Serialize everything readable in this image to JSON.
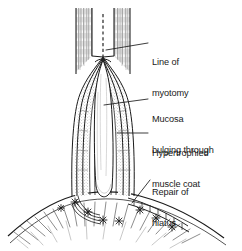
{
  "figure": {
    "background_color": "#ffffff",
    "ink_color": "#1a1a1a",
    "stipple_color": "#8d8d8d",
    "width": 242,
    "height": 251
  },
  "annotations": [
    {
      "id": "line-of-myotomy",
      "line1": "Line of",
      "line2": "myotomy",
      "leader_from": [
        148,
        43
      ],
      "leader_to": [
        106,
        50
      ]
    },
    {
      "id": "mucosa-bulging-through",
      "line1": "Mucosa",
      "line2": "bulging through",
      "leader_from": [
        148,
        99
      ],
      "leader_to": [
        104,
        105
      ]
    },
    {
      "id": "hypertrophied-muscle-coat",
      "line1": "Hypertrophied",
      "line2": "muscle coat",
      "leader_from": [
        148,
        133
      ],
      "leader_to": [
        118,
        133
      ]
    },
    {
      "id": "repair-of-hiatus",
      "line1": "Repair of",
      "line2": "hiatus",
      "leader_from": [
        150,
        180
      ],
      "leader_to": [
        132,
        203
      ]
    }
  ],
  "structures": {
    "oesophagus": "oesophageal tube with longitudinal muscle hatching",
    "myotomy_incision": "dashed vertical line marking the intended incision",
    "split_muscle": "hypertrophied muscle coat retracted to either side",
    "mucosa": "mucosa bulging through the myotomy",
    "diaphragm": "diaphragm with radiating fibre strokes",
    "sutures": "interrupted star sutures closing the hiatus"
  }
}
